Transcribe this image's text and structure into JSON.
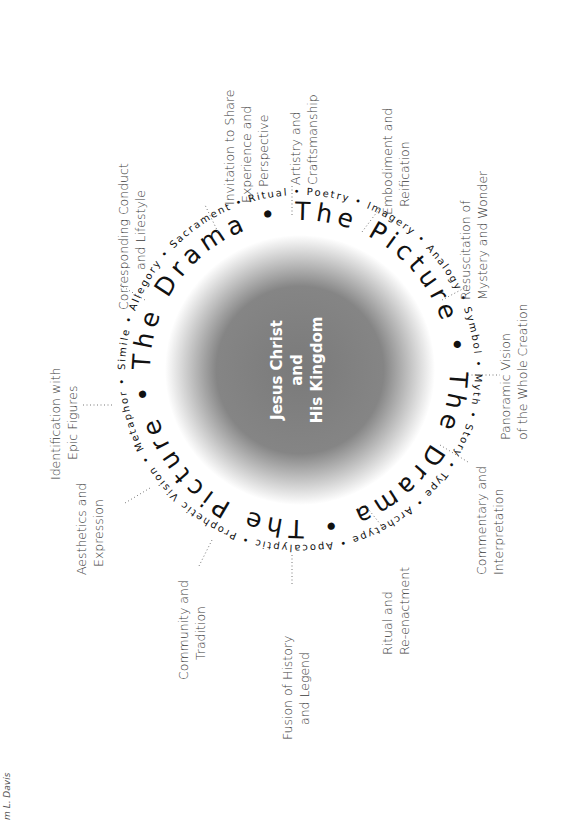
{
  "diagram": {
    "center": {
      "lines": [
        "Jesus Christ",
        "and",
        "His Kingdom"
      ],
      "fill_dark": "#7a7a7a",
      "fill_light": "#ffffff"
    },
    "ring_big_text": "The Drama • The Picture • The Drama • The Picture •",
    "ring_small_text": "Simile • Allegory • Sacrament • Ritual • Poetry • Imagery • Analogy • Symbol • Myth • Story • Type • Archetype • Apocalyptic • Prophetic Vision • Metaphor •",
    "outer_labels": [
      {
        "id": "artistry",
        "lines": [
          "Artistry and",
          "Craftsmanship"
        ]
      },
      {
        "id": "embodiment",
        "lines": [
          "Embodiment and",
          "Reification"
        ]
      },
      {
        "id": "resuscitation",
        "lines": [
          "Resuscitation of",
          "Mystery and Wonder"
        ]
      },
      {
        "id": "panoramic",
        "lines": [
          "Panoramic Vision",
          "of the Whole Creation"
        ]
      },
      {
        "id": "commentary",
        "lines": [
          "Commentary and",
          "Interpretation"
        ]
      },
      {
        "id": "ritual",
        "lines": [
          "Ritual and",
          "Re-enactment"
        ]
      },
      {
        "id": "fusion",
        "lines": [
          "Fusion of History",
          "and Legend"
        ]
      },
      {
        "id": "community",
        "lines": [
          "Community and",
          "Tradition"
        ]
      },
      {
        "id": "aesthetics",
        "lines": [
          "Aesthetics and",
          "Expression"
        ]
      },
      {
        "id": "identification",
        "lines": [
          "Identification with",
          "Epic Figures"
        ]
      },
      {
        "id": "corresponding",
        "lines": [
          "Corresponding Conduct",
          "and Lifestyle"
        ]
      },
      {
        "id": "invitation",
        "lines": [
          "Invitation to Share",
          "Experience and",
          "Perspective"
        ]
      }
    ],
    "credit": "m L. Davis"
  }
}
